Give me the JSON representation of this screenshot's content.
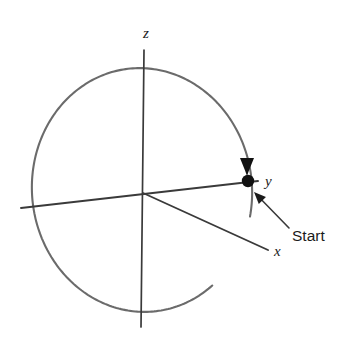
{
  "figure": {
    "type": "vector-diagram",
    "background_color": "#ffffff"
  },
  "colors": {
    "circle_stroke": "#6b6b6b",
    "axis_stroke": "#3a3a3a",
    "marker_fill": "#111111",
    "text_color": "#1b1b1b"
  },
  "axes": {
    "z": {
      "label": "z",
      "label_x": 146,
      "label_y": 38,
      "top_x": 144,
      "top_y": 50,
      "bottom_x": 141,
      "bottom_y": 327
    },
    "y": {
      "label": "y",
      "label_x": 265,
      "label_y": 186,
      "left_x": 21,
      "left_y": 208,
      "right_x": 258,
      "right_y": 181
    },
    "x": {
      "label": "x",
      "label_x": 274,
      "label_y": 256,
      "end_x": 268,
      "end_y": 250
    },
    "origin_x": 143,
    "origin_y": 193
  },
  "circle": {
    "name": "trajectory-circle",
    "center_x": 142,
    "center_y": 190,
    "radius_x": 110,
    "radius_y": 122,
    "rotation_deg": -6,
    "gap_start_deg": 18,
    "gap_end_deg": 57,
    "stroke_width": 2.1
  },
  "marker": {
    "name": "start-point",
    "x": 248,
    "y": 181,
    "radius": 6.2
  },
  "direction_arrow": {
    "name": "direction-arrowhead",
    "tip_x": 247,
    "tip_y": 176,
    "points_direction": "down",
    "width": 14,
    "height": 18
  },
  "callout": {
    "label": "Start",
    "label_x": 292,
    "label_y": 241,
    "arrow_tail_x": 289,
    "arrow_tail_y": 228,
    "arrow_tip_x": 254,
    "arrow_tip_y": 192
  },
  "chart_data": {
    "type": "scatter",
    "title": "",
    "xlabel": "",
    "ylabel": "",
    "annotations": [
      "z",
      "y",
      "x",
      "Start"
    ],
    "series": [
      {
        "name": "circular-trajectory",
        "description": "Near-circular path in the x-y-z frame, drawn with a gap in the lower right quadrant",
        "x": [],
        "values": []
      },
      {
        "name": "start-marker",
        "description": "Filled dot on the circle along the positive y axis with a downward arrowhead indicating travel direction",
        "x": [
          248
        ],
        "values": [
          181
        ]
      }
    ]
  }
}
